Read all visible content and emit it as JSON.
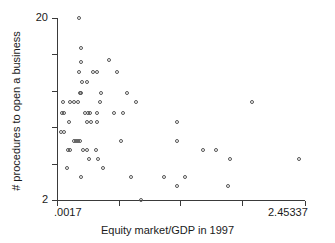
{
  "chart_data": {
    "type": "scatter",
    "title": "",
    "xlabel": "Equity market/GDP in 1997",
    "ylabel": "# procedures to open a business",
    "xlim": [
      0.0017,
      2.45337
    ],
    "ylim": [
      2,
      20
    ],
    "grid": false,
    "legend": null,
    "x_tick_labels": [
      ".0017",
      "",
      "",
      "",
      "2.45337"
    ],
    "x_tick_values": [
      0.0017,
      0.61,
      1.22,
      1.83,
      2.45337
    ],
    "y_tick_labels": [
      "20",
      "",
      "",
      "",
      "",
      "2"
    ],
    "y_tick_values": [
      20,
      16.4,
      12.8,
      9.2,
      5.6,
      2
    ],
    "marker": "open-circle",
    "marker_color": "#555555",
    "axis_color": "#3a3a3a",
    "points": [
      {
        "x": 0.22,
        "y": 20.0
      },
      {
        "x": 0.24,
        "y": 17.0
      },
      {
        "x": 0.24,
        "y": 15.6
      },
      {
        "x": 0.52,
        "y": 15.8
      },
      {
        "x": 0.22,
        "y": 14.6
      },
      {
        "x": 0.36,
        "y": 14.6
      },
      {
        "x": 0.4,
        "y": 14.6
      },
      {
        "x": 0.6,
        "y": 14.6
      },
      {
        "x": 0.25,
        "y": 13.6
      },
      {
        "x": 0.3,
        "y": 13.6
      },
      {
        "x": 0.23,
        "y": 12.5
      },
      {
        "x": 0.245,
        "y": 12.5
      },
      {
        "x": 0.44,
        "y": 12.5
      },
      {
        "x": 0.7,
        "y": 12.5
      },
      {
        "x": 0.07,
        "y": 11.6
      },
      {
        "x": 0.14,
        "y": 11.6
      },
      {
        "x": 0.175,
        "y": 11.6
      },
      {
        "x": 0.21,
        "y": 11.6
      },
      {
        "x": 0.43,
        "y": 11.6
      },
      {
        "x": 0.79,
        "y": 11.6
      },
      {
        "x": 1.93,
        "y": 11.6
      },
      {
        "x": 0.055,
        "y": 10.6
      },
      {
        "x": 0.075,
        "y": 10.6
      },
      {
        "x": 0.28,
        "y": 10.6
      },
      {
        "x": 0.31,
        "y": 10.6
      },
      {
        "x": 0.335,
        "y": 10.6
      },
      {
        "x": 0.4,
        "y": 10.6
      },
      {
        "x": 0.57,
        "y": 10.6
      },
      {
        "x": 0.655,
        "y": 10.6
      },
      {
        "x": 0.13,
        "y": 9.7
      },
      {
        "x": 0.3,
        "y": 9.7
      },
      {
        "x": 0.345,
        "y": 9.7
      },
      {
        "x": 0.4,
        "y": 9.7
      },
      {
        "x": 1.19,
        "y": 9.7
      },
      {
        "x": 0.045,
        "y": 8.7
      },
      {
        "x": 0.075,
        "y": 8.7
      },
      {
        "x": 0.175,
        "y": 7.8
      },
      {
        "x": 0.195,
        "y": 7.8
      },
      {
        "x": 0.215,
        "y": 7.8
      },
      {
        "x": 0.235,
        "y": 7.8
      },
      {
        "x": 0.64,
        "y": 7.8
      },
      {
        "x": 1.19,
        "y": 7.8
      },
      {
        "x": 0.115,
        "y": 6.9
      },
      {
        "x": 0.135,
        "y": 6.9
      },
      {
        "x": 0.265,
        "y": 6.9
      },
      {
        "x": 0.3,
        "y": 6.9
      },
      {
        "x": 0.395,
        "y": 6.9
      },
      {
        "x": 1.45,
        "y": 6.9
      },
      {
        "x": 1.58,
        "y": 6.9
      },
      {
        "x": 0.325,
        "y": 6.0
      },
      {
        "x": 0.415,
        "y": 6.0
      },
      {
        "x": 1.72,
        "y": 6.0
      },
      {
        "x": 2.4,
        "y": 6.0
      },
      {
        "x": 0.105,
        "y": 5.1
      },
      {
        "x": 0.46,
        "y": 5.1
      },
      {
        "x": 0.245,
        "y": 4.2
      },
      {
        "x": 0.74,
        "y": 4.2
      },
      {
        "x": 1.06,
        "y": 4.2
      },
      {
        "x": 1.27,
        "y": 4.2
      },
      {
        "x": 1.19,
        "y": 3.3
      },
      {
        "x": 1.7,
        "y": 3.3
      },
      {
        "x": 0.84,
        "y": 2.0
      }
    ]
  }
}
